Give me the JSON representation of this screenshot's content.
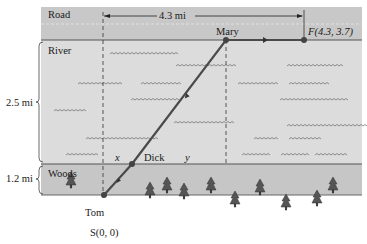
{
  "regions": {
    "road": {
      "label": "Road",
      "color": "#c8c8c8"
    },
    "river": {
      "label": "River",
      "color": "#dcdcdc",
      "height_label": "2.5 mi"
    },
    "woods": {
      "label": "Woods",
      "color": "#c6c6c6",
      "height_label": "1.2 mi"
    }
  },
  "dimension": {
    "label": "4.3 mi"
  },
  "points": {
    "start": {
      "label": "S(0, 0)",
      "name": "Tom"
    },
    "dick": {
      "label": "Dick"
    },
    "mary": {
      "label": "Mary"
    },
    "finish": {
      "label": "F(4.3, 3.7)"
    }
  },
  "segments": {
    "x_label": "x",
    "y_label": "y"
  },
  "colors": {
    "path": "#4a4a4a",
    "frame": "#555555",
    "dashed": "#333333"
  }
}
